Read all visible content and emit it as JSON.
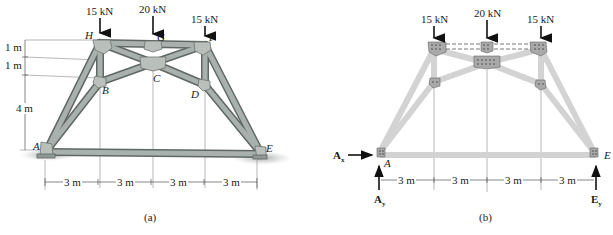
{
  "figure_a": {
    "caption": "(a)",
    "loads": [
      {
        "label": "15 kN",
        "node": "H"
      },
      {
        "label": "20 kN",
        "node": "G"
      },
      {
        "label": "15 kN",
        "node": "F"
      }
    ],
    "nodes": {
      "A": "A",
      "B": "B",
      "C": "C",
      "D": "D",
      "E": "E",
      "F": "F",
      "G": "G",
      "H": "H"
    },
    "vertical_dims": [
      "1 m",
      "1 m",
      "4 m"
    ],
    "horizontal_dims": [
      "3 m",
      "3 m",
      "3 m",
      "3 m"
    ]
  },
  "figure_b": {
    "caption": "(b)",
    "loads": [
      {
        "label": "15 kN",
        "node": "H"
      },
      {
        "label": "20 kN",
        "node": "G"
      },
      {
        "label": "15 kN",
        "node": "F"
      }
    ],
    "nodes": {
      "A": "A",
      "E": "E"
    },
    "reactions": {
      "Ax": "A",
      "Ax_sub": "x",
      "Ay": "A",
      "Ay_sub": "y",
      "Ey": "E",
      "Ey_sub": "y"
    },
    "horizontal_dims": [
      "3 m",
      "3 m",
      "3 m",
      "3 m"
    ]
  },
  "colors": {
    "member_a": "#8f9a96",
    "member_a_dark": "#5f6864",
    "member_b": "#d3d3d3",
    "plate_b": "#9a9a9a",
    "dim_line": "#555555",
    "arrow": "#111111"
  }
}
